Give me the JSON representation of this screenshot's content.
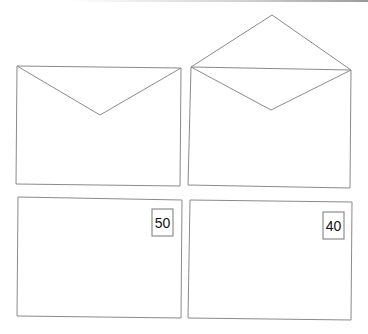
{
  "figure": {
    "panels": [
      {
        "id": "closed-envelope",
        "type": "envelope-back",
        "flap": "closed"
      },
      {
        "id": "open-envelope",
        "type": "envelope-back",
        "flap": "open"
      },
      {
        "id": "envelope-front-50",
        "type": "envelope-front",
        "stamp_value": "50"
      },
      {
        "id": "envelope-front-40",
        "type": "envelope-front",
        "stamp_value": "40"
      }
    ],
    "stroke_color": "#8a8a8a",
    "stamp_border_color": "#777777"
  }
}
